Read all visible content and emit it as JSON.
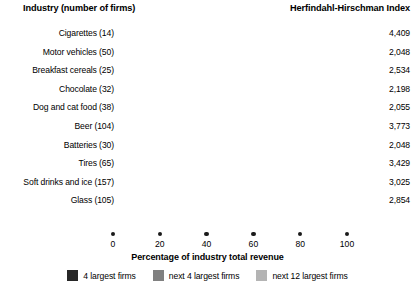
{
  "header": {
    "left": "Industry (number of firms)",
    "right": "Herfindahl-Hirschman Index"
  },
  "axis": {
    "title": "Percentage of industry total revenue",
    "ticks": [
      "0",
      "20",
      "40",
      "60",
      "80",
      "100"
    ],
    "min": 0,
    "max": 100
  },
  "legend": {
    "items": [
      {
        "label": "4 largest firms",
        "color": "#272727",
        "swatch_name": "legend-swatch-4-largest"
      },
      {
        "label": "next 4 largest firms",
        "color": "#808080",
        "swatch_name": "legend-swatch-next-4"
      },
      {
        "label": "next 12 largest firms",
        "color": "#b4b4b4",
        "swatch_name": "legend-swatch-next-12"
      }
    ]
  },
  "colors": {
    "segment_4_largest": "#272727",
    "segment_next_4": "#808080",
    "segment_next_12": "#b4b4b4",
    "text": "#000000",
    "background": "#ffffff"
  },
  "chart_data": {
    "type": "bar",
    "orientation": "horizontal",
    "stacked": true,
    "title": "",
    "xlabel": "Percentage of industry total revenue",
    "ylabel": "Industry (number of firms)",
    "xlim": [
      0,
      100
    ],
    "xticks": [
      0,
      20,
      40,
      60,
      80,
      100
    ],
    "grid": false,
    "legend_position": "bottom",
    "categories": [
      "Cigarettes (14)",
      "Motor vehicles (50)",
      "Breakfast cereals (25)",
      "Chocolate (32)",
      "Dog and cat food (38)",
      "Beer (104)",
      "Batteries (30)",
      "Tires (65)",
      "Soft drinks and ice (157)",
      "Glass (105)"
    ],
    "series": [
      {
        "name": "4 largest firms",
        "values": [
          97,
          83,
          82,
          82,
          83,
          94,
          77,
          91,
          87,
          75
        ]
      },
      {
        "name": "next 4 largest firms",
        "values": [
          0,
          17,
          0,
          18,
          0,
          6,
          23,
          9,
          11,
          25
        ]
      },
      {
        "name": "next 12 largest firms",
        "values": [
          3,
          0,
          18,
          0,
          17,
          0,
          0,
          0,
          2,
          0
        ]
      }
    ],
    "annotations": {
      "right_axis_label": "Herfindahl-Hirschman Index",
      "right_values": [
        "4,409",
        "2,048",
        "2,534",
        "2,198",
        "2,055",
        "3,773",
        "2,048",
        "3,429",
        "3,025",
        "2,854"
      ]
    }
  },
  "rows": [
    {
      "label": "Cigarettes (14)",
      "hhi": "4,409",
      "segments": [
        97,
        0,
        3
      ]
    },
    {
      "label": "Motor vehicles (50)",
      "hhi": "2,048",
      "segments": [
        83,
        17,
        0
      ]
    },
    {
      "label": "Breakfast cereals (25)",
      "hhi": "2,534",
      "segments": [
        82,
        0,
        18
      ]
    },
    {
      "label": "Chocolate (32)",
      "hhi": "2,198",
      "segments": [
        82,
        18,
        0
      ]
    },
    {
      "label": "Dog and cat food (38)",
      "hhi": "2,055",
      "segments": [
        83,
        0,
        17
      ]
    },
    {
      "label": "Beer (104)",
      "hhi": "3,773",
      "segments": [
        94,
        6,
        0
      ]
    },
    {
      "label": "Batteries (30)",
      "hhi": "2,048",
      "segments": [
        77,
        23,
        0
      ]
    },
    {
      "label": "Tires (65)",
      "hhi": "3,429",
      "segments": [
        91,
        9,
        0
      ]
    },
    {
      "label": "Soft drinks and ice (157)",
      "hhi": "3,025",
      "segments": [
        87,
        11,
        2
      ]
    },
    {
      "label": "Glass (105)",
      "hhi": "2,854",
      "segments": [
        75,
        25,
        0
      ]
    }
  ]
}
